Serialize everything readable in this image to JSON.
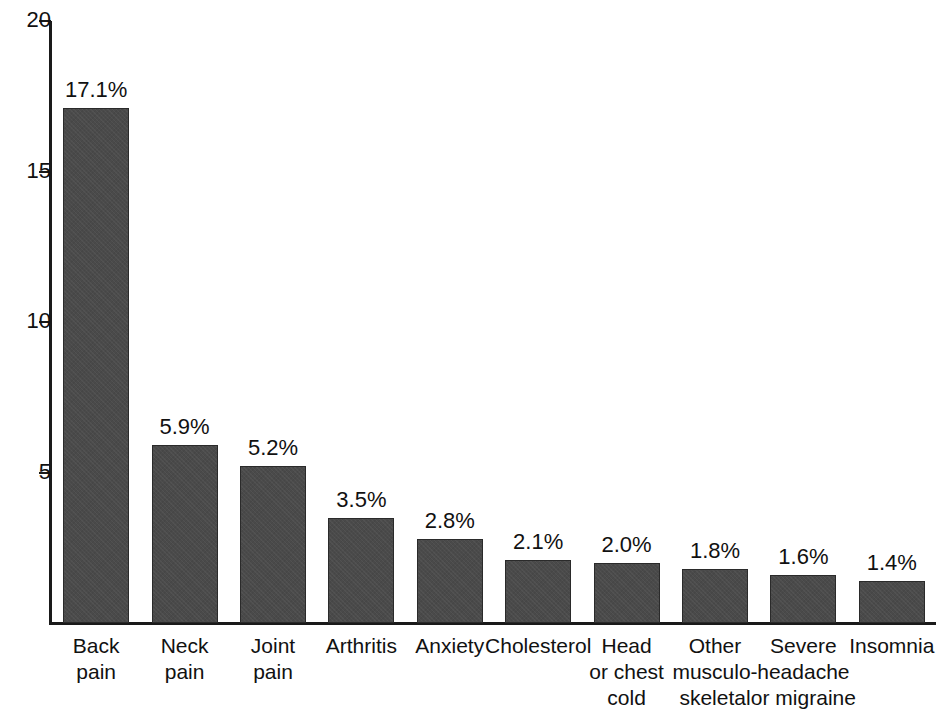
{
  "chart_data": {
    "type": "bar",
    "title": "",
    "subtitle": "",
    "xlabel": "",
    "ylabel": "",
    "ylim": [
      0,
      20
    ],
    "yticks": [
      20,
      15,
      10,
      5
    ],
    "ytick_labels": [
      "20",
      "15",
      "10",
      "5"
    ],
    "grid": false,
    "legend": null,
    "bar_color": "#4a4a4a",
    "axis_color": "#1a1a1a",
    "value_suffix": "%",
    "categories": [
      "Back pain",
      "Neck pain",
      "Joint pain",
      "Arthritis",
      "Anxiety",
      "Cholesterol",
      "Head or chest cold",
      "Other musculo-skeletal",
      "Severe headache or migraine",
      "Insomnia"
    ],
    "category_lines": [
      [
        "Back",
        "pain"
      ],
      [
        "Neck",
        "pain"
      ],
      [
        "Joint",
        "pain"
      ],
      [
        "Arthritis"
      ],
      [
        "Anxiety"
      ],
      [
        "Cholesterol"
      ],
      [
        "Head",
        "or chest",
        "cold"
      ],
      [
        "Other",
        "musculo-",
        "skeletal"
      ],
      [
        "Severe",
        "headache",
        "or migraine"
      ],
      [
        "Insomnia"
      ]
    ],
    "values": [
      17.1,
      5.9,
      5.2,
      3.5,
      2.8,
      2.1,
      2.0,
      1.8,
      1.6,
      1.4
    ],
    "value_labels": [
      "17.1%",
      "5.9%",
      "5.2%",
      "3.5%",
      "2.8%",
      "2.1%",
      "2.0%",
      "1.8%",
      "1.6%",
      "1.4%"
    ]
  }
}
